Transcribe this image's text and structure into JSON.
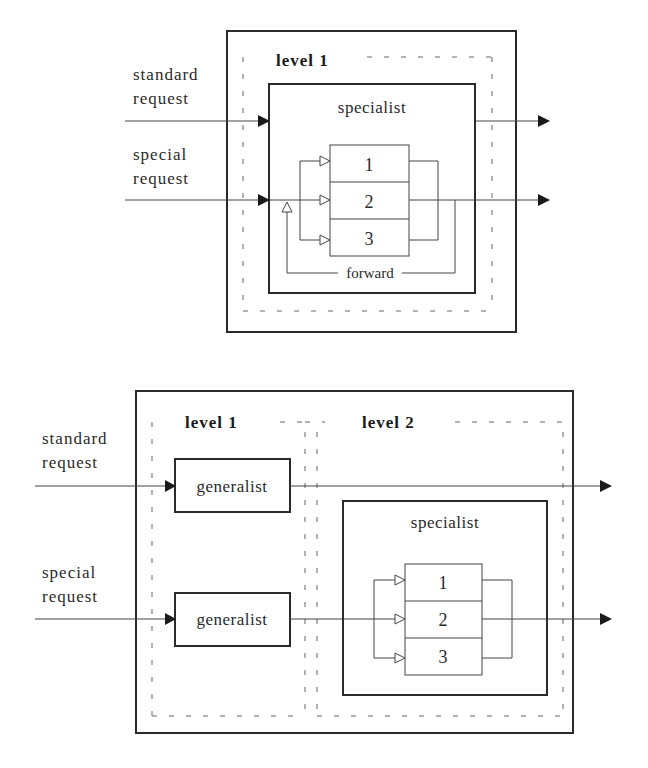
{
  "top_diagram": {
    "inputs": [
      {
        "label_line1": "standard",
        "label_line2": "request"
      },
      {
        "label_line1": "special",
        "label_line2": "request"
      }
    ],
    "level_label": "level 1",
    "specialist_label": "specialist",
    "sub_units": [
      "1",
      "2",
      "3"
    ],
    "forward_label": "forward"
  },
  "bottom_diagram": {
    "inputs": [
      {
        "label_line1": "standard",
        "label_line2": "request"
      },
      {
        "label_line1": "special",
        "label_line2": "request"
      }
    ],
    "level1_label": "level 1",
    "level2_label": "level 2",
    "generalist_labels": [
      "generalist",
      "generalist"
    ],
    "specialist_label": "specialist",
    "sub_units": [
      "1",
      "2",
      "3"
    ]
  },
  "colors": {
    "line": "#2a2a2a",
    "background": "#ffffff"
  }
}
